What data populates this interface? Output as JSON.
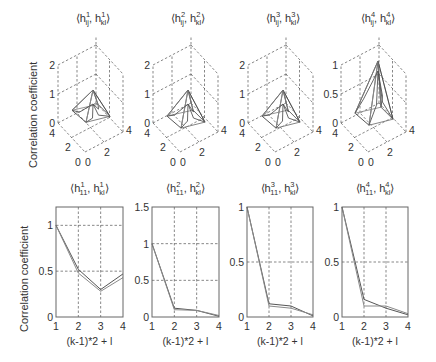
{
  "figure": {
    "ylabel_top": "Correlation coefficient",
    "ylabel_bottom": "Correlation coefficient"
  },
  "chart_data": [
    {
      "type": "surface",
      "title": "⟨h^1_ij, h^1_kl⟩",
      "title_parts": {
        "base": "h",
        "sup": "1",
        "sub1": "ij",
        "sub2": "kl"
      },
      "ylabel": "Correlation coefficient",
      "zticks": [
        "0",
        "1",
        "2"
      ],
      "zlim": [
        0,
        2
      ],
      "xticks": [
        "0",
        "2",
        "4"
      ],
      "yticks": [
        "0",
        "2",
        "4"
      ],
      "peak": 1.0,
      "floor": 0.3,
      "grid": true
    },
    {
      "type": "surface",
      "title": "⟨h^2_ij, h^2_kl⟩",
      "title_parts": {
        "base": "h",
        "sup": "2",
        "sub1": "ij",
        "sub2": "kl"
      },
      "zticks": [
        "0",
        "1",
        "2"
      ],
      "zlim": [
        0,
        2
      ],
      "xticks": [
        "0",
        "2",
        "4"
      ],
      "yticks": [
        "0",
        "2",
        "4"
      ],
      "peak": 1.0,
      "floor": 0.1,
      "grid": true
    },
    {
      "type": "surface",
      "title": "⟨h^3_ij, h^3_kl⟩",
      "title_parts": {
        "base": "h",
        "sup": "3",
        "sub1": "ij",
        "sub2": "kl"
      },
      "zticks": [
        "0",
        "1",
        "2"
      ],
      "zlim": [
        0,
        2
      ],
      "xticks": [
        "0",
        "2",
        "4"
      ],
      "yticks": [
        "0",
        "2",
        "4"
      ],
      "peak": 1.0,
      "floor": 0.1,
      "grid": true
    },
    {
      "type": "surface",
      "title": "⟨h^4_ij, h^4_kl⟩",
      "title_parts": {
        "base": "h",
        "sup": "4",
        "sub1": "ij",
        "sub2": "kl"
      },
      "zticks": [
        "0",
        "0.5",
        "1"
      ],
      "zlim": [
        0,
        1
      ],
      "xticks": [
        "0",
        "2",
        "4"
      ],
      "yticks": [
        "0",
        "2",
        "4"
      ],
      "peak": 1.0,
      "floor": 0.1,
      "grid": true
    },
    {
      "type": "line",
      "title": "⟨h^1_11, h^1_kl⟩",
      "title_parts": {
        "base": "h",
        "sup": "1",
        "sub1": "11",
        "sub2": "kl"
      },
      "xlabel": "(k-1)*2 + l",
      "ylabel": "Correlation coefficient",
      "x": [
        1,
        2,
        3,
        4
      ],
      "xticks": [
        "1",
        "2",
        "3",
        "4"
      ],
      "yticks": [
        "0",
        "0.5",
        "1"
      ],
      "ytick_values": [
        0,
        0.5,
        1
      ],
      "xlim": [
        1,
        4
      ],
      "ylim": [
        0,
        1.2
      ],
      "series": [
        {
          "name": "series-a",
          "values": [
            1.0,
            0.52,
            0.3,
            0.47
          ]
        },
        {
          "name": "series-b",
          "values": [
            1.0,
            0.48,
            0.28,
            0.43
          ]
        }
      ],
      "grid": true
    },
    {
      "type": "line",
      "title": "⟨h^2_11, h^2_kl⟩",
      "title_parts": {
        "base": "h",
        "sup": "2",
        "sub1": "11",
        "sub2": "kl"
      },
      "xlabel": "(k-1)*2 + l",
      "x": [
        1,
        2,
        3,
        4
      ],
      "xticks": [
        "1",
        "2",
        "3",
        "4"
      ],
      "yticks": [
        "0",
        "0.5",
        "1",
        "1.5"
      ],
      "ytick_values": [
        0,
        0.5,
        1,
        1.5
      ],
      "xlim": [
        1,
        4
      ],
      "ylim": [
        0,
        1.5
      ],
      "series": [
        {
          "name": "series-a",
          "values": [
            1.0,
            0.12,
            0.09,
            0.01
          ]
        },
        {
          "name": "series-b",
          "values": [
            1.0,
            0.1,
            0.09,
            0.02
          ]
        }
      ],
      "grid": true
    },
    {
      "type": "line",
      "title": "⟨h^3_11, h^3_kl⟩",
      "title_parts": {
        "base": "h",
        "sup": "3",
        "sub1": "11",
        "sub2": "kl"
      },
      "xlabel": "(k-1)*2 + l",
      "x": [
        1,
        2,
        3,
        4
      ],
      "xticks": [
        "1",
        "2",
        "3",
        "4"
      ],
      "yticks": [
        "0",
        "0.5",
        "1"
      ],
      "ytick_values": [
        0,
        0.5,
        1
      ],
      "xlim": [
        1,
        4
      ],
      "ylim": [
        0,
        1
      ],
      "series": [
        {
          "name": "series-a",
          "values": [
            1.0,
            0.12,
            0.1,
            0.01
          ]
        },
        {
          "name": "series-b",
          "values": [
            1.0,
            0.1,
            0.08,
            0.02
          ]
        }
      ],
      "grid": true
    },
    {
      "type": "line",
      "title": "⟨h^4_11, h^4_kl⟩",
      "title_parts": {
        "base": "h",
        "sup": "4",
        "sub1": "11",
        "sub2": "kl"
      },
      "xlabel": "(k-1)*2 + l",
      "x": [
        1,
        2,
        3,
        4
      ],
      "xticks": [
        "1",
        "2",
        "3",
        "4"
      ],
      "yticks": [
        "0",
        "0.5",
        "1"
      ],
      "ytick_values": [
        0,
        0.5,
        1
      ],
      "xlim": [
        1,
        4
      ],
      "ylim": [
        0,
        1
      ],
      "series": [
        {
          "name": "series-a",
          "values": [
            1.0,
            0.16,
            0.08,
            0.02
          ]
        },
        {
          "name": "series-b",
          "values": [
            1.0,
            0.1,
            0.1,
            0.03
          ]
        }
      ],
      "grid": true
    }
  ],
  "colors": {
    "line_a": "#555555",
    "line_b": "#8a8a8a",
    "axis": "#666666",
    "grid": "#555555",
    "text": "#333333"
  }
}
